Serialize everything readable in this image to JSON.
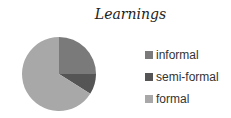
{
  "chart_data": {
    "type": "pie",
    "title": "Learnings",
    "categories": [
      "informal",
      "semi-formal",
      "formal"
    ],
    "values": [
      25,
      9,
      66
    ],
    "colors": [
      "#7a7a7a",
      "#555555",
      "#a8a8a8"
    ],
    "legend_position": "right"
  }
}
